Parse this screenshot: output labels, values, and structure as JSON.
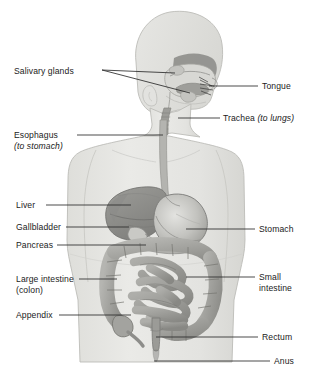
{
  "figure": {
    "background_color": "#ffffff",
    "body_fill": "#e4e4e1",
    "body_outline": "#b9b9b5",
    "organ_dark": "#8d8d8a",
    "organ_mid": "#a9a9a5",
    "organ_light": "#cfcfcb",
    "leader_color": "#2a2a2a",
    "text_color": "#1b1b1b"
  },
  "labels_left": [
    {
      "id": "salivary-glands",
      "text": "Salivary glands",
      "x": 14,
      "y": 66,
      "leaders": [
        {
          "x1": 102,
          "y1": 70,
          "x2": 175,
          "y2": 73
        },
        {
          "x1": 102,
          "y1": 70,
          "x2": 190,
          "y2": 93
        }
      ]
    },
    {
      "id": "esophagus",
      "text": "Esophagus",
      "sub": "(to stomach)",
      "sub_italic": true,
      "x": 14,
      "y": 130,
      "leaders": [
        {
          "x1": 77,
          "y1": 135,
          "x2": 163,
          "y2": 135
        }
      ]
    },
    {
      "id": "liver",
      "text": "Liver",
      "x": 16,
      "y": 200,
      "leaders": [
        {
          "x1": 46,
          "y1": 205,
          "x2": 131,
          "y2": 205
        }
      ]
    },
    {
      "id": "gallbladder",
      "text": "Gallbladder",
      "x": 16,
      "y": 222,
      "leaders": [
        {
          "x1": 66,
          "y1": 227,
          "x2": 129,
          "y2": 227
        }
      ]
    },
    {
      "id": "pancreas",
      "text": "Pancreas",
      "x": 16,
      "y": 240,
      "leaders": [
        {
          "x1": 57,
          "y1": 245,
          "x2": 146,
          "y2": 245
        }
      ]
    },
    {
      "id": "large-intestine",
      "text": "Large intestine",
      "sub": "(colon)",
      "sub_italic": false,
      "x": 16,
      "y": 274,
      "leaders": [
        {
          "x1": 79,
          "y1": 279,
          "x2": 117,
          "y2": 279
        }
      ]
    },
    {
      "id": "appendix",
      "text": "Appendix",
      "x": 16,
      "y": 310,
      "leaders": [
        {
          "x1": 59,
          "y1": 315,
          "x2": 131,
          "y2": 315
        }
      ]
    }
  ],
  "labels_right": [
    {
      "id": "tongue",
      "text": "Tongue",
      "x": 262,
      "y": 81,
      "leaders": [
        {
          "x1": 209,
          "y1": 86,
          "x2": 258,
          "y2": 86
        }
      ]
    },
    {
      "id": "trachea",
      "text": "Trachea ",
      "italic_tail": "(to lungs)",
      "x": 223,
      "y": 113,
      "leaders": [
        {
          "x1": 178,
          "y1": 118,
          "x2": 220,
          "y2": 118
        }
      ]
    },
    {
      "id": "stomach",
      "text": "Stomach",
      "x": 259,
      "y": 224,
      "leaders": [
        {
          "x1": 186,
          "y1": 229,
          "x2": 255,
          "y2": 229
        }
      ]
    },
    {
      "id": "small-intestine",
      "text": "Small",
      "sub": "intestine",
      "sub_italic": false,
      "x": 259,
      "y": 272,
      "leaders": [
        {
          "x1": 186,
          "y1": 277,
          "x2": 255,
          "y2": 277
        }
      ]
    },
    {
      "id": "rectum",
      "text": "Rectum",
      "x": 262,
      "y": 332,
      "leaders": [
        {
          "x1": 156,
          "y1": 337,
          "x2": 258,
          "y2": 337
        }
      ]
    },
    {
      "id": "anus",
      "text": "Anus",
      "x": 274,
      "y": 356,
      "leaders": [
        {
          "x1": 154,
          "y1": 361,
          "x2": 270,
          "y2": 361
        }
      ]
    }
  ]
}
